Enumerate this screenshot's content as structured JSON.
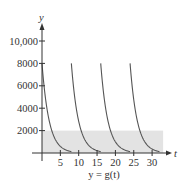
{
  "chart_data": {
    "type": "line",
    "title": "",
    "caption": "y = g(t)",
    "xlabel": "t",
    "ylabel": "y",
    "xlim": [
      0,
      35
    ],
    "ylim": [
      0,
      11000
    ],
    "x_ticks": [
      5,
      10,
      15,
      20,
      25,
      30
    ],
    "y_ticks": [
      2000,
      4000,
      6000,
      8000,
      10000
    ],
    "x_tick_labels": [
      "5",
      "10",
      "15",
      "20",
      "25",
      "30"
    ],
    "y_tick_labels": [
      "2000",
      "4000",
      "6000",
      "8000",
      "10,000"
    ],
    "grid": false,
    "shaded_band": {
      "y_min": 0,
      "y_max": 2000,
      "x_min": 0,
      "x_max": 33,
      "color": "#e3e3e3"
    },
    "series": [
      {
        "name": "dose 1",
        "x": [
          0,
          1,
          2,
          3,
          4,
          5,
          6,
          7,
          8
        ],
        "values": [
          8000,
          4800,
          2900,
          1700,
          1000,
          600,
          370,
          220,
          130
        ]
      },
      {
        "name": "dose 2",
        "x": [
          8,
          9,
          10,
          11,
          12,
          13,
          14,
          15,
          16
        ],
        "values": [
          8000,
          4800,
          2900,
          1700,
          1000,
          600,
          370,
          220,
          130
        ]
      },
      {
        "name": "dose 3",
        "x": [
          16,
          17,
          18,
          19,
          20,
          21,
          22,
          23,
          24
        ],
        "values": [
          8000,
          4800,
          2900,
          1700,
          1000,
          600,
          370,
          220,
          130
        ]
      },
      {
        "name": "dose 4",
        "x": [
          24,
          25,
          26,
          27,
          28,
          29,
          30,
          31,
          32
        ],
        "values": [
          8000,
          4800,
          2900,
          1700,
          1000,
          600,
          370,
          220,
          130
        ]
      }
    ],
    "colors": {
      "curve": "#555555",
      "axis": "#333333",
      "band": "#e3e3e3"
    }
  }
}
